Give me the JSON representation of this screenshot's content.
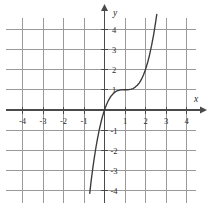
{
  "figure": {
    "title": "",
    "background_color": "#ffffff",
    "grid_color": "#9a9a9a",
    "axis_color": "#4a4a4a",
    "curve_color": "#3a3a3a"
  },
  "axes": {
    "x_label": "x",
    "y_label": "y",
    "x_tick_labels": [
      "-4",
      "-3",
      "-2",
      "-1",
      "1",
      "2",
      "3",
      "4"
    ],
    "y_tick_labels": [
      "4",
      "3",
      "2",
      "1",
      "-1",
      "-2",
      "-3",
      "-4"
    ]
  },
  "chart_data": {
    "type": "line",
    "title": "",
    "xlabel": "x",
    "ylabel": "y",
    "xlim": [
      -4.6,
      4.7
    ],
    "ylim": [
      -4.8,
      4.7
    ],
    "grid": true,
    "legend": "none",
    "xticks": [
      -4,
      -3,
      -2,
      -1,
      1,
      2,
      3,
      4
    ],
    "yticks": [
      4,
      3,
      2,
      1,
      -1,
      -2,
      -3,
      -4
    ],
    "series": [
      {
        "name": "y = (x - 1)^3 + 1",
        "expression": "(x-1)^3+1",
        "inflection_point": [
          1,
          1
        ],
        "x": [
          -0.72,
          -0.65,
          -0.6,
          -0.55,
          -0.5,
          -0.45,
          -0.4,
          -0.35,
          -0.3,
          -0.25,
          -0.2,
          -0.15,
          -0.1,
          -0.05,
          0,
          0.1,
          0.2,
          0.3,
          0.4,
          0.5,
          0.6,
          0.7,
          0.8,
          0.9,
          1,
          1.1,
          1.2,
          1.3,
          1.4,
          1.5,
          1.6,
          1.7,
          1.8,
          1.9,
          2,
          2.1,
          2.2,
          2.3,
          2.4,
          2.5,
          2.55
        ],
        "y": [
          -4.12,
          -3.49,
          -3.1,
          -2.72,
          -2.38,
          -2.05,
          -1.74,
          -1.46,
          -1.2,
          -0.95,
          -0.73,
          -0.52,
          -0.33,
          -0.16,
          0,
          0.27,
          0.49,
          0.66,
          0.78,
          0.88,
          0.94,
          0.97,
          0.99,
          1.0,
          1.0,
          1.0,
          1.01,
          1.03,
          1.06,
          1.13,
          1.22,
          1.34,
          1.51,
          1.73,
          2.0,
          2.33,
          2.73,
          3.2,
          3.74,
          4.38,
          4.72
        ]
      }
    ]
  }
}
